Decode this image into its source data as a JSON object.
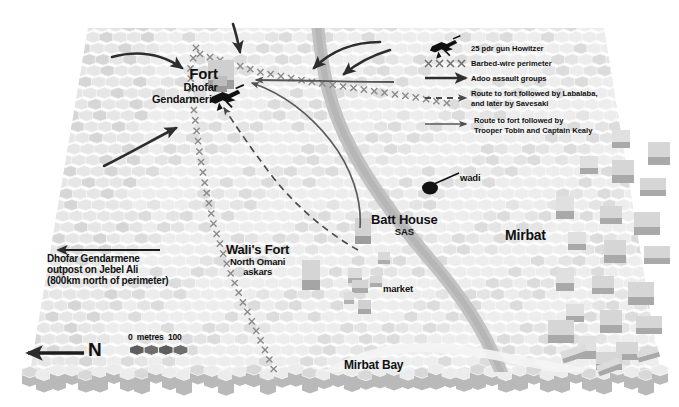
{
  "map": {
    "title": "Mirbat battle map",
    "terrain": "hexagonal tile plateau",
    "labels": {
      "fort_name": "Fort",
      "fort_sub1": "Dhofar",
      "fort_sub2": "Gendarmerie",
      "dg_outpost_line1": "Dhofar Gendarmene",
      "dg_outpost_line2": "outpost on Jebel Ali",
      "dg_outpost_line3": "(800km north of perimeter)",
      "walis_fort": "Wali's Fort",
      "walis_fort_sub1": "North Omani",
      "walis_fort_sub2": "askars",
      "batt_house": "Batt House",
      "batt_house_sub": "SAS",
      "market": "market",
      "wadi": "wadi",
      "mirbat": "Mirbat",
      "mirbat_bay": "Mirbat Bay"
    },
    "scale": {
      "zero": "0",
      "unit": "metres",
      "max": "100"
    },
    "compass": {
      "north_label": "N",
      "direction": "arrow points left (west on page = north)"
    },
    "colors": {
      "hex_light": "#ededed",
      "hex_mid": "#dcdcdc",
      "hex_dark": "#c9c9c9",
      "wadi": "#bdbdbd",
      "building_top": "#dedede",
      "building_side": "#a8a8a8",
      "ink": "#111111",
      "route_dashed": "#4a4a4a",
      "route_solid": "#5a5a5a"
    }
  },
  "legend": {
    "title": "Map key",
    "items": [
      {
        "symbol": "howitzer-icon",
        "label": "25 pdr gun Howitzer"
      },
      {
        "symbol": "barbed-wire-icon",
        "label": "Barbed-wire perimeter"
      },
      {
        "symbol": "solid-arrow-icon",
        "label": "Adoo assault groups"
      },
      {
        "symbol": "dashed-arrow-icon",
        "label": "Route to fort followed by Labalaba,",
        "label2": "and later by Savesaki"
      },
      {
        "symbol": "thin-arrow-icon",
        "label": "Route to fort followed by",
        "label2": "Trooper Tobin and Captain Kealy"
      }
    ]
  }
}
